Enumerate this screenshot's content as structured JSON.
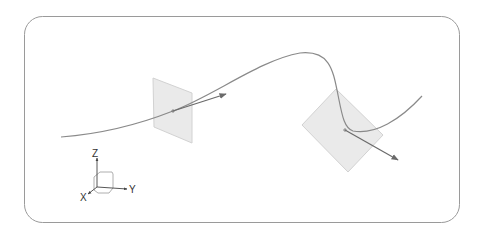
{
  "diagram": {
    "type": "3d-curve-with-normal-planes",
    "frame": {
      "x": 24,
      "y": 16,
      "width": 435,
      "height": 206,
      "radius": 18,
      "stroke": "#9a9a9a"
    },
    "curve": {
      "stroke": "#8a8a8a",
      "path": "M61,137 C100,134 140,124 173,111 C215,95 260,60 300,53 C330,50 333,70 338,95 C342,115 344,128 353,131 C375,135 400,120 422,96"
    },
    "planes": [
      {
        "id": "plane-1",
        "points": "153,78 192,93 192,143 154,127",
        "fill": "#e6e6e6",
        "stroke": "#d2d2d2",
        "point": [
          173,
          111
        ]
      },
      {
        "id": "plane-2",
        "points": "302,125 336,89 383,135 348,172",
        "fill": "#e6e6e6",
        "stroke": "#d2d2d2",
        "point": [
          345,
          130
        ]
      }
    ],
    "arrows": [
      {
        "id": "tangent-arrow-1",
        "from": [
          173,
          111
        ],
        "to": [
          226,
          94
        ],
        "color": "#6a6a6a"
      },
      {
        "id": "tangent-arrow-2",
        "from": [
          345,
          130
        ],
        "to": [
          398,
          160
        ],
        "color": "#6a6a6a"
      }
    ],
    "axes": {
      "origin": [
        97,
        187
      ],
      "labels": {
        "z": "Z",
        "y": "Y",
        "x": "X"
      },
      "color": "#444444"
    }
  }
}
